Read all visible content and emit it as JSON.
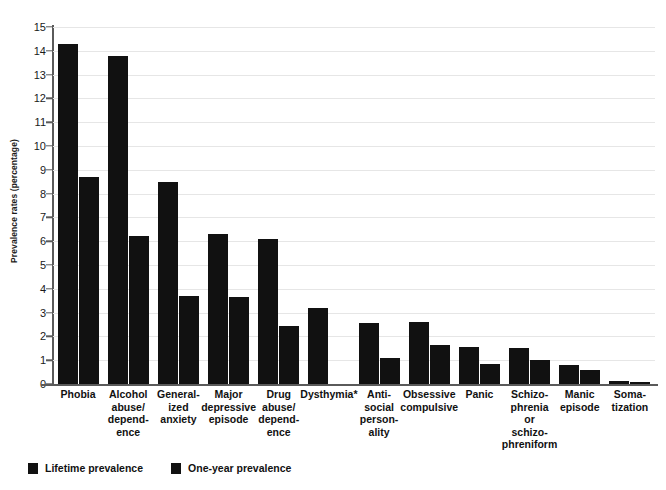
{
  "chart_data": {
    "type": "bar",
    "title": "",
    "subtitle": "",
    "xlabel": "",
    "ylabel": "Prevalence rates (percentage)",
    "ylim": [
      0,
      15
    ],
    "ytick_step": 1,
    "yticks": [
      "15",
      "14",
      "13",
      "12",
      "11",
      "10",
      "9",
      "8",
      "7",
      "6",
      "5",
      "4",
      "3",
      "2",
      "1",
      "0"
    ],
    "grid": true,
    "grid_axis": "y",
    "legend_position": "bottom-left",
    "bar_color": "#111111",
    "grid_color": "#e6e6e6",
    "axis_color": "#5a5a5a",
    "categories": [
      "Phobia",
      "Alcohol abuse/dependence",
      "Generalized anxiety",
      "Major depressive episode",
      "Drug abuse/dependence",
      "Dysthymia*",
      "Anti-social personality",
      "Obsessive compulsive",
      "Panic",
      "Schizophrenia or schizophreniform",
      "Manic episode",
      "Somatization"
    ],
    "category_label_lines": [
      [
        "Phobia"
      ],
      [
        "Alcohol",
        "abuse/",
        "depend-",
        "ence"
      ],
      [
        "General-",
        "ized",
        "anxiety"
      ],
      [
        "Major",
        "depressive",
        "episode"
      ],
      [
        "Drug",
        "abuse/",
        "depend-",
        "ence"
      ],
      [
        "Dysthymia*"
      ],
      [
        "Anti-",
        "social",
        "person-",
        "ality"
      ],
      [
        "Obsessive",
        "compulsive"
      ],
      [
        "Panic"
      ],
      [
        "Schizo-",
        "phrenia",
        "or",
        "schizo-",
        "phreniform"
      ],
      [
        "Manic",
        "episode"
      ],
      [
        "Soma-",
        "tization"
      ]
    ],
    "series": [
      {
        "name": "Lifetime prevalence",
        "values": [
          14.3,
          13.8,
          8.5,
          6.3,
          6.1,
          3.2,
          2.55,
          2.6,
          1.55,
          1.5,
          0.8,
          0.12
        ]
      },
      {
        "name": "One-year prevalence",
        "values": [
          8.7,
          6.2,
          3.7,
          3.65,
          2.45,
          null,
          1.1,
          1.65,
          0.85,
          1.0,
          0.6,
          0.08
        ]
      }
    ],
    "annotations": [
      "* Dysthymia one-year prevalence not reported"
    ]
  },
  "legend": {
    "items": [
      {
        "label": "Lifetime prevalence",
        "color": "#111111"
      },
      {
        "label": "One-year prevalence",
        "color": "#111111"
      }
    ]
  }
}
